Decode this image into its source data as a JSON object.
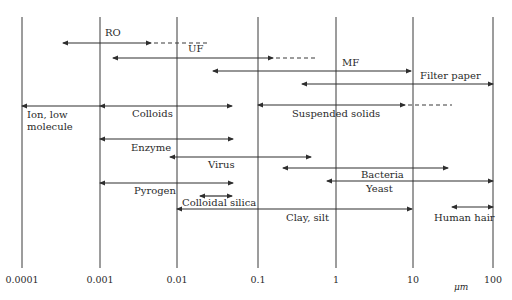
{
  "diagram": {
    "title": "",
    "unit_label": "μm",
    "axis": {
      "scale": "log",
      "ticks": [
        {
          "label": "0.0001",
          "x": 22
        },
        {
          "label": "0.001",
          "x": 100
        },
        {
          "label": "0.01",
          "x": 177
        },
        {
          "label": "0.1",
          "x": 258
        },
        {
          "label": "1",
          "x": 336
        },
        {
          "label": "10",
          "x": 413
        },
        {
          "label": "100",
          "x": 493
        }
      ],
      "grid_top": 17,
      "grid_bottom": 268,
      "tick_label_y": 283
    },
    "separation_processes": [
      {
        "label": "RO",
        "y": 43,
        "x1": 63,
        "x2": 151,
        "dash_to": 208,
        "label_x": 105,
        "label_y": 36,
        "left_arrow": true,
        "right_arrow": true
      },
      {
        "label": "UF",
        "y": 58,
        "x1": 113,
        "x2": 273,
        "dash_to": 316,
        "label_x": 188,
        "label_y": 52,
        "left_arrow": true,
        "right_arrow": true
      },
      {
        "label": "MF",
        "y": 71,
        "x1": 213,
        "x2": 411,
        "dash_to": null,
        "label_x": 342,
        "label_y": 66,
        "left_arrow": true,
        "right_arrow": true
      },
      {
        "label": "Filter paper",
        "y": 84,
        "x1": 302,
        "x2": 493,
        "dash_to": null,
        "label_x": 420,
        "label_y": 79,
        "left_arrow": true,
        "right_arrow": true
      }
    ],
    "particles": [
      {
        "label": "Ion, low",
        "label2": "molecule",
        "y": 106,
        "x1": 22,
        "x2": 100,
        "label_x": 27,
        "label_y": 118,
        "left_arrow": true,
        "right_arrow": false
      },
      {
        "label": "Colloids",
        "y": 106,
        "x1": 100,
        "x2": 232,
        "label_x": 132,
        "label_y": 117,
        "left_arrow": true,
        "right_arrow": true
      },
      {
        "label": "Suspended solids",
        "y": 105,
        "x1": 258,
        "x2": 405,
        "dash_to": 452,
        "label_x": 292,
        "label_y": 117,
        "left_arrow": true,
        "right_arrow": true
      },
      {
        "label": "Enzyme",
        "y": 139,
        "x1": 100,
        "x2": 233,
        "label_x": 131,
        "label_y": 151,
        "left_arrow": true,
        "right_arrow": true
      },
      {
        "label": "Virus",
        "y": 157,
        "x1": 170,
        "x2": 311,
        "label_x": 208,
        "label_y": 168,
        "left_arrow": true,
        "right_arrow": true
      },
      {
        "label": "Bacteria",
        "y": 168,
        "x1": 283,
        "x2": 448,
        "label_x": 361,
        "label_y": 178,
        "left_arrow": true,
        "right_arrow": true
      },
      {
        "label": "Yeast",
        "y": 181,
        "x1": 327,
        "x2": 493,
        "label_x": 366,
        "label_y": 192,
        "left_arrow": true,
        "right_arrow": true
      },
      {
        "label": "Pyrogen",
        "y": 183,
        "x1": 100,
        "x2": 233,
        "label_x": 134,
        "label_y": 194,
        "left_arrow": true,
        "right_arrow": true
      },
      {
        "label": "Colloidal silica",
        "y": 196,
        "x1": 200,
        "x2": 232,
        "label_x": 182,
        "label_y": 206,
        "left_arrow": true,
        "right_arrow": true
      },
      {
        "label": "Clay, silt",
        "y": 209,
        "x1": 177,
        "x2": 412,
        "label_x": 286,
        "label_y": 221,
        "left_arrow": true,
        "right_arrow": true
      },
      {
        "label": "Human hair",
        "y": 207,
        "x1": 452,
        "x2": 493,
        "label_x": 434,
        "label_y": 221,
        "left_arrow": true,
        "right_arrow": true
      }
    ],
    "colors": {
      "ink": "#2e2e2e",
      "background": "#ffffff"
    }
  }
}
